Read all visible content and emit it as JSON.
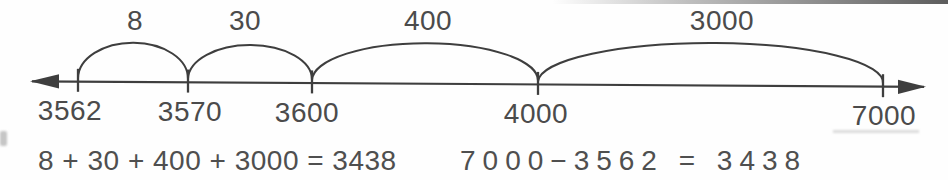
{
  "figure": {
    "description_colors": {
      "ink": "#3e3e3e",
      "text": "#4b4b4b",
      "background": "#fefefe"
    }
  },
  "number_line": {
    "points": [
      {
        "value": "3562"
      },
      {
        "value": "3570"
      },
      {
        "value": "3600"
      },
      {
        "value": "4000"
      },
      {
        "value": "7000"
      }
    ],
    "jumps": [
      {
        "label": "8",
        "from": "3562",
        "to": "3570"
      },
      {
        "label": "30",
        "from": "3570",
        "to": "3600"
      },
      {
        "label": "400",
        "from": "3600",
        "to": "4000"
      },
      {
        "label": "3000",
        "from": "4000",
        "to": "7000"
      }
    ]
  },
  "equations": {
    "sum": "8 + 30 + 400 + 3000 = 3438",
    "difference": "7000−3562 = 3438"
  }
}
